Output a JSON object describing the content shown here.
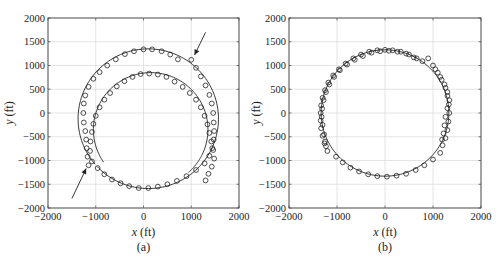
{
  "chart_data": [
    {
      "type": "scatter",
      "panel": "(a)",
      "title": "",
      "caption": "(a)",
      "xlabel": "x (ft)",
      "ylabel": "y (ft)",
      "xlim": [
        -2000,
        2000
      ],
      "ylim": [
        -2000,
        2000
      ],
      "xticks": [
        -2000,
        -1000,
        0,
        1000,
        2000
      ],
      "yticks": [
        -2000,
        -1500,
        -1000,
        -500,
        0,
        500,
        1000,
        1500,
        2000
      ],
      "grid": true,
      "legend": null,
      "series": [
        {
          "name": "estimated trajectory (markers)",
          "style": "open-circle",
          "points": [
            [
              -1150,
              -1100
            ],
            [
              -1170,
              -920
            ],
            [
              -1190,
              -740
            ],
            [
              -1200,
              -560
            ],
            [
              -1220,
              -380
            ],
            [
              -1250,
              -200
            ],
            [
              -1260,
              0
            ],
            [
              -1250,
              200
            ],
            [
              -1220,
              370
            ],
            [
              -1150,
              550
            ],
            [
              -1050,
              720
            ],
            [
              -920,
              860
            ],
            [
              -760,
              1000
            ],
            [
              -580,
              1130
            ],
            [
              -390,
              1240
            ],
            [
              -200,
              1300
            ],
            [
              0,
              1340
            ],
            [
              180,
              1340
            ],
            [
              380,
              1300
            ],
            [
              560,
              1230
            ],
            [
              720,
              1130
            ],
            [
              1000,
              1120
            ],
            [
              1100,
              950
            ],
            [
              1200,
              770
            ],
            [
              1300,
              580
            ],
            [
              1380,
              380
            ],
            [
              1430,
              200
            ],
            [
              1460,
              0
            ],
            [
              1470,
              -200
            ],
            [
              1480,
              -380
            ],
            [
              1470,
              -560
            ],
            [
              1440,
              -740
            ],
            [
              1380,
              -900
            ],
            [
              1280,
              -1060
            ],
            [
              1100,
              -1200
            ],
            [
              900,
              -1330
            ],
            [
              700,
              -1430
            ],
            [
              500,
              -1500
            ],
            [
              300,
              -1550
            ],
            [
              100,
              -1580
            ],
            [
              -100,
              -1580
            ],
            [
              -300,
              -1540
            ],
            [
              -480,
              -1480
            ],
            [
              -660,
              -1400
            ],
            [
              -820,
              -1290
            ],
            [
              -960,
              -1160
            ],
            [
              -1080,
              -1020
            ],
            [
              -1120,
              -800
            ],
            [
              -1110,
              -600
            ],
            [
              -1080,
              -400
            ],
            [
              -1050,
              -230
            ],
            [
              -1000,
              -60
            ],
            [
              -920,
              120
            ],
            [
              -820,
              280
            ],
            [
              -700,
              420
            ],
            [
              -560,
              560
            ],
            [
              -400,
              670
            ],
            [
              -230,
              760
            ],
            [
              -60,
              820
            ],
            [
              120,
              830
            ],
            [
              300,
              810
            ],
            [
              480,
              760
            ],
            [
              650,
              660
            ],
            [
              820,
              550
            ],
            [
              970,
              420
            ],
            [
              1100,
              280
            ],
            [
              1200,
              120
            ],
            [
              1280,
              -60
            ],
            [
              1340,
              -240
            ],
            [
              1380,
              -420
            ],
            [
              1420,
              -600
            ],
            [
              1460,
              -780
            ],
            [
              1480,
              -960
            ],
            [
              1430,
              -1130
            ],
            [
              1360,
              -1280
            ],
            [
              1300,
              -1420
            ]
          ]
        },
        {
          "name": "true trajectory (line)",
          "style": "solid-line",
          "description": "two overlapping near-circular arcs: outer arc centered ~(100,-120) r~1470, inner arc centered ~(150,-350) r~1200"
        }
      ],
      "annotations": [
        {
          "type": "arrow",
          "from": [
            1300,
            1700
          ],
          "to": [
            1070,
            1220
          ]
        },
        {
          "type": "arrow",
          "from": [
            -1500,
            -1800
          ],
          "to": [
            -1200,
            -1170
          ]
        }
      ]
    },
    {
      "type": "scatter",
      "panel": "(b)",
      "title": "",
      "caption": "(b)",
      "xlabel": "x (ft)",
      "ylabel": "y (ft)",
      "xlim": [
        -2000,
        2000
      ],
      "ylim": [
        -2000,
        2000
      ],
      "xticks": [
        -2000,
        -1000,
        0,
        1000,
        2000
      ],
      "yticks": [
        -2000,
        -1500,
        -1000,
        -500,
        0,
        500,
        1000,
        1500,
        2000
      ],
      "grid": true,
      "legend": null,
      "series": [
        {
          "name": "estimated trajectory (markers)",
          "style": "open-circle",
          "points": [
            [
              -1200,
              -800
            ],
            [
              -1260,
              -640
            ],
            [
              -1300,
              -480
            ],
            [
              -1330,
              -320
            ],
            [
              -1340,
              -160
            ],
            [
              -1340,
              0
            ],
            [
              -1330,
              160
            ],
            [
              -1300,
              320
            ],
            [
              -1250,
              480
            ],
            [
              -1180,
              640
            ],
            [
              -1080,
              790
            ],
            [
              -960,
              920
            ],
            [
              -820,
              1040
            ],
            [
              -660,
              1150
            ],
            [
              -500,
              1230
            ],
            [
              -330,
              1290
            ],
            [
              -160,
              1320
            ],
            [
              0,
              1330
            ],
            [
              160,
              1320
            ],
            [
              330,
              1290
            ],
            [
              500,
              1230
            ],
            [
              660,
              1150
            ],
            [
              900,
              1150
            ],
            [
              1000,
              1000
            ],
            [
              1100,
              850
            ],
            [
              1180,
              700
            ],
            [
              1260,
              530
            ],
            [
              1300,
              360
            ],
            [
              1330,
              180
            ],
            [
              1340,
              0
            ],
            [
              1320,
              -180
            ],
            [
              1300,
              -360
            ],
            [
              1260,
              -530
            ],
            [
              1200,
              -680
            ],
            [
              1150,
              -840
            ],
            [
              1000,
              -980
            ],
            [
              820,
              -1100
            ],
            [
              640,
              -1200
            ],
            [
              440,
              -1280
            ],
            [
              240,
              -1320
            ],
            [
              40,
              -1340
            ],
            [
              -160,
              -1330
            ],
            [
              -350,
              -1290
            ],
            [
              -540,
              -1230
            ],
            [
              -720,
              -1150
            ],
            [
              -880,
              -1040
            ],
            [
              -1020,
              -920
            ],
            [
              -1250,
              -600
            ],
            [
              -1230,
              -700
            ],
            [
              -1270,
              -450
            ],
            [
              -1300,
              -250
            ],
            [
              -1320,
              -80
            ],
            [
              -1310,
              90
            ],
            [
              -1280,
              270
            ],
            [
              -1230,
              440
            ],
            [
              -1160,
              600
            ],
            [
              -1060,
              760
            ],
            [
              -940,
              900
            ],
            [
              -790,
              1020
            ],
            [
              -630,
              1120
            ],
            [
              -460,
              1200
            ],
            [
              -280,
              1270
            ],
            [
              -100,
              1300
            ],
            [
              80,
              1310
            ],
            [
              260,
              1290
            ],
            [
              440,
              1250
            ],
            [
              600,
              1170
            ],
            [
              780,
              1090
            ],
            [
              1050,
              920
            ],
            [
              1150,
              760
            ],
            [
              1240,
              600
            ],
            [
              1300,
              440
            ],
            [
              1340,
              270
            ],
            [
              1300,
              100
            ],
            [
              1260,
              -80
            ],
            [
              1240,
              -260
            ],
            [
              1220,
              -430
            ],
            [
              1190,
              -560
            ]
          ]
        },
        {
          "name": "true trajectory (line)",
          "style": "solid-line",
          "description": "circle centered ~(0,0) r~1330"
        }
      ]
    }
  ],
  "panels": {
    "a": {
      "caption": "(a)",
      "xlabel_var": "x",
      "xlabel_unit": " (ft)",
      "ylabel_var": "y",
      "ylabel_unit": " (ft)",
      "xticks": [
        "−2000",
        "−1000",
        "0",
        "1000",
        "2000"
      ],
      "yticks": [
        "2000",
        "1500",
        "1000",
        "500",
        "0",
        "−500",
        "−1000",
        "−1500",
        "−2000"
      ]
    },
    "b": {
      "caption": "(b)",
      "xlabel_var": "x",
      "xlabel_unit": " (ft)",
      "ylabel_var": "y",
      "ylabel_unit": " (ft)",
      "xticks": [
        "−2000",
        "−1000",
        "0",
        "1000",
        "2000"
      ],
      "yticks": [
        "2000",
        "1500",
        "1000",
        "500",
        "0",
        "−500",
        "−1000",
        "−1500",
        "−2000"
      ]
    }
  },
  "colors": {
    "ink": "#222222",
    "grid": "#d9d9d9",
    "frame": "#444444",
    "background": "#ffffff"
  }
}
